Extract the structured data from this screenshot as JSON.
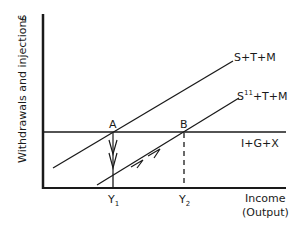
{
  "diagram": {
    "axes": {
      "y_label": "Withdrawals and injections",
      "y_unit": "£",
      "x_label_line1": "Income",
      "x_label_line2": "(Output)"
    },
    "lines": {
      "withdrawals_original": "S+T+M",
      "withdrawals_shifted": "S",
      "withdrawals_shifted_sup": "11",
      "withdrawals_shifted_rest": "+T+M",
      "injections": "I+G+X"
    },
    "points": {
      "a": "A",
      "b": "B"
    },
    "ticks": {
      "y1": "Y",
      "y1_sub": "1",
      "y2": "Y",
      "y2_sub": "2"
    },
    "colors": {
      "ink": "#1a1a1a",
      "background": "#ffffff"
    }
  }
}
